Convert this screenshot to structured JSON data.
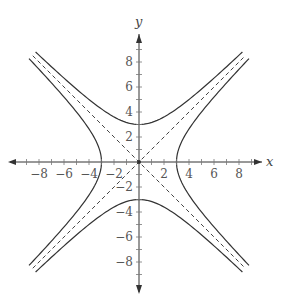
{
  "chart_data": {
    "type": "line",
    "title": "",
    "xlabel": "x",
    "ylabel": "y",
    "xlim": [
      -9.5,
      10
    ],
    "ylim": [
      -9.5,
      9.5
    ],
    "grid": false,
    "x_ticks": [
      -8,
      -6,
      -4,
      -2,
      2,
      4,
      6,
      8
    ],
    "y_ticks": [
      8,
      6,
      4,
      2,
      -2,
      -4,
      -6,
      -8
    ],
    "series": [
      {
        "name": "hyperbola-vertical",
        "equation": "y^2/9 - x^2/9 = 1",
        "style": "solid",
        "vertices": [
          [
            0,
            3
          ],
          [
            0,
            -3
          ]
        ]
      },
      {
        "name": "hyperbola-horizontal",
        "equation": "x^2/9 - y^2/9 = 1",
        "style": "solid",
        "vertices": [
          [
            3,
            0
          ],
          [
            -3,
            0
          ]
        ]
      },
      {
        "name": "asymptote-1",
        "equation": "y = x",
        "style": "dashed"
      },
      {
        "name": "asymptote-2",
        "equation": "y = -x",
        "style": "dashed"
      }
    ],
    "curve_extent": 8.5
  },
  "axes": {
    "x_label": "x",
    "y_label": "y",
    "x_tick_labels": [
      "−8",
      "−6",
      "−4",
      "−2",
      "2",
      "4",
      "6",
      "8"
    ],
    "y_tick_labels": [
      "8",
      "6",
      "4",
      "2",
      "−2",
      "−4",
      "−6",
      "−8"
    ]
  },
  "colors": {
    "axis": "#333333",
    "curve": "#333333",
    "asymptote": "#444444",
    "label": "#555555"
  }
}
